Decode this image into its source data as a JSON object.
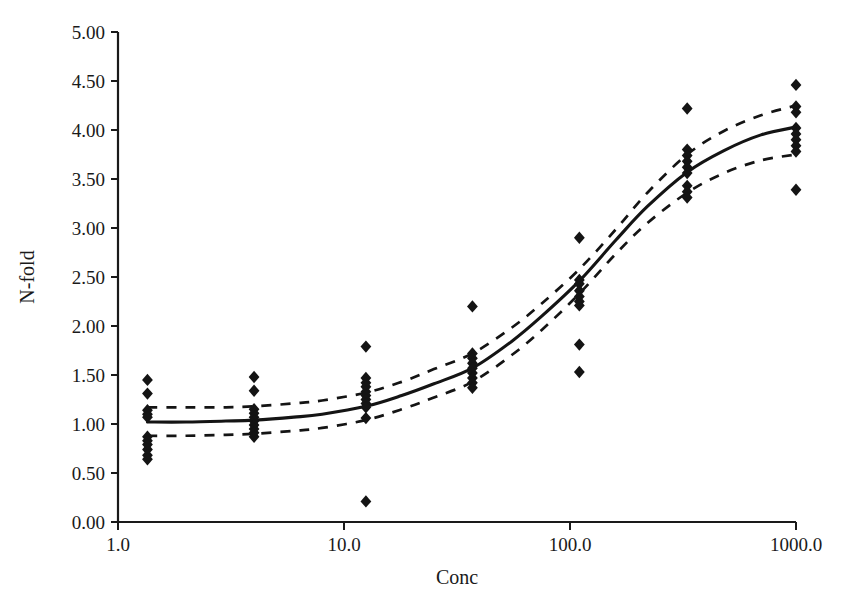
{
  "chart_data": {
    "type": "scatter",
    "title": "",
    "xlabel": "Conc",
    "ylabel": "N-fold",
    "xscale": "log",
    "yscale": "linear",
    "xlim": [
      1.0,
      1000.0
    ],
    "ylim": [
      0.0,
      5.0
    ],
    "grid": false,
    "legend": "none",
    "x_ticks": [
      "1.0",
      "10.0",
      "100.0",
      "1000.0"
    ],
    "x_tick_values": [
      1.0,
      10.0,
      100.0,
      1000.0
    ],
    "y_ticks": [
      "0.00",
      "0.50",
      "1.00",
      "1.50",
      "2.00",
      "2.50",
      "3.00",
      "3.50",
      "4.00",
      "4.50",
      "5.00"
    ],
    "y_tick_values": [
      0.0,
      0.5,
      1.0,
      1.5,
      2.0,
      2.5,
      3.0,
      3.5,
      4.0,
      4.5,
      5.0
    ],
    "marker": "diamond",
    "marker_color": "#141414",
    "series": [
      {
        "name": "Observed N-fold",
        "type": "scatter",
        "points": [
          {
            "x": 1.35,
            "y": 1.45
          },
          {
            "x": 1.35,
            "y": 1.31
          },
          {
            "x": 1.35,
            "y": 1.14
          },
          {
            "x": 1.35,
            "y": 1.1
          },
          {
            "x": 1.35,
            "y": 1.07
          },
          {
            "x": 1.35,
            "y": 0.87
          },
          {
            "x": 1.35,
            "y": 0.83
          },
          {
            "x": 1.35,
            "y": 0.79
          },
          {
            "x": 1.35,
            "y": 0.74
          },
          {
            "x": 1.35,
            "y": 0.68
          },
          {
            "x": 1.35,
            "y": 0.64
          },
          {
            "x": 4.0,
            "y": 1.48
          },
          {
            "x": 4.0,
            "y": 1.34
          },
          {
            "x": 4.0,
            "y": 1.15
          },
          {
            "x": 4.0,
            "y": 1.11
          },
          {
            "x": 4.0,
            "y": 1.07
          },
          {
            "x": 4.0,
            "y": 1.03
          },
          {
            "x": 4.0,
            "y": 0.99
          },
          {
            "x": 4.0,
            "y": 0.95
          },
          {
            "x": 4.0,
            "y": 0.91
          },
          {
            "x": 4.0,
            "y": 0.87
          },
          {
            "x": 12.5,
            "y": 1.79
          },
          {
            "x": 12.5,
            "y": 1.47
          },
          {
            "x": 12.5,
            "y": 1.42
          },
          {
            "x": 12.5,
            "y": 1.38
          },
          {
            "x": 12.5,
            "y": 1.33
          },
          {
            "x": 12.5,
            "y": 1.29
          },
          {
            "x": 12.5,
            "y": 1.25
          },
          {
            "x": 12.5,
            "y": 1.21
          },
          {
            "x": 12.5,
            "y": 1.17
          },
          {
            "x": 12.5,
            "y": 1.06
          },
          {
            "x": 12.5,
            "y": 0.21
          },
          {
            "x": 37.0,
            "y": 2.2
          },
          {
            "x": 37.0,
            "y": 1.72
          },
          {
            "x": 37.0,
            "y": 1.67
          },
          {
            "x": 37.0,
            "y": 1.62
          },
          {
            "x": 37.0,
            "y": 1.57
          },
          {
            "x": 37.0,
            "y": 1.52
          },
          {
            "x": 37.0,
            "y": 1.47
          },
          {
            "x": 37.0,
            "y": 1.42
          },
          {
            "x": 37.0,
            "y": 1.37
          },
          {
            "x": 110.0,
            "y": 2.9
          },
          {
            "x": 110.0,
            "y": 2.47
          },
          {
            "x": 110.0,
            "y": 2.43
          },
          {
            "x": 110.0,
            "y": 2.36
          },
          {
            "x": 110.0,
            "y": 2.3
          },
          {
            "x": 110.0,
            "y": 2.25
          },
          {
            "x": 110.0,
            "y": 2.21
          },
          {
            "x": 110.0,
            "y": 1.81
          },
          {
            "x": 110.0,
            "y": 1.53
          },
          {
            "x": 330.0,
            "y": 4.22
          },
          {
            "x": 330.0,
            "y": 3.8
          },
          {
            "x": 330.0,
            "y": 3.74
          },
          {
            "x": 330.0,
            "y": 3.68
          },
          {
            "x": 330.0,
            "y": 3.62
          },
          {
            "x": 330.0,
            "y": 3.56
          },
          {
            "x": 330.0,
            "y": 3.43
          },
          {
            "x": 330.0,
            "y": 3.37
          },
          {
            "x": 330.0,
            "y": 3.31
          },
          {
            "x": 1000.0,
            "y": 4.46
          },
          {
            "x": 1000.0,
            "y": 4.24
          },
          {
            "x": 1000.0,
            "y": 4.18
          },
          {
            "x": 1000.0,
            "y": 4.02
          },
          {
            "x": 1000.0,
            "y": 3.96
          },
          {
            "x": 1000.0,
            "y": 3.9
          },
          {
            "x": 1000.0,
            "y": 3.84
          },
          {
            "x": 1000.0,
            "y": 3.78
          },
          {
            "x": 1000.0,
            "y": 3.39
          }
        ]
      },
      {
        "name": "Fitted curve",
        "type": "line",
        "style": "solid",
        "points": [
          {
            "x": 1.35,
            "y": 1.02
          },
          {
            "x": 2.0,
            "y": 1.02
          },
          {
            "x": 3.0,
            "y": 1.03
          },
          {
            "x": 4.0,
            "y": 1.04
          },
          {
            "x": 6.0,
            "y": 1.07
          },
          {
            "x": 8.0,
            "y": 1.1
          },
          {
            "x": 12.5,
            "y": 1.18
          },
          {
            "x": 18.0,
            "y": 1.29
          },
          {
            "x": 25.0,
            "y": 1.41
          },
          {
            "x": 37.0,
            "y": 1.57
          },
          {
            "x": 55.0,
            "y": 1.84
          },
          {
            "x": 75.0,
            "y": 2.1
          },
          {
            "x": 110.0,
            "y": 2.46
          },
          {
            "x": 160.0,
            "y": 2.88
          },
          {
            "x": 220.0,
            "y": 3.22
          },
          {
            "x": 330.0,
            "y": 3.57
          },
          {
            "x": 480.0,
            "y": 3.79
          },
          {
            "x": 700.0,
            "y": 3.95
          },
          {
            "x": 1000.0,
            "y": 4.03
          }
        ]
      },
      {
        "name": "Upper confidence band",
        "type": "line",
        "style": "dashed",
        "points": [
          {
            "x": 1.35,
            "y": 1.17
          },
          {
            "x": 2.0,
            "y": 1.17
          },
          {
            "x": 3.0,
            "y": 1.17
          },
          {
            "x": 4.0,
            "y": 1.18
          },
          {
            "x": 6.0,
            "y": 1.21
          },
          {
            "x": 8.0,
            "y": 1.24
          },
          {
            "x": 12.5,
            "y": 1.32
          },
          {
            "x": 18.0,
            "y": 1.43
          },
          {
            "x": 25.0,
            "y": 1.56
          },
          {
            "x": 37.0,
            "y": 1.72
          },
          {
            "x": 55.0,
            "y": 1.98
          },
          {
            "x": 75.0,
            "y": 2.23
          },
          {
            "x": 110.0,
            "y": 2.58
          },
          {
            "x": 160.0,
            "y": 2.99
          },
          {
            "x": 220.0,
            "y": 3.36
          },
          {
            "x": 330.0,
            "y": 3.75
          },
          {
            "x": 480.0,
            "y": 3.99
          },
          {
            "x": 700.0,
            "y": 4.15
          },
          {
            "x": 1000.0,
            "y": 4.25
          }
        ]
      },
      {
        "name": "Lower confidence band",
        "type": "line",
        "style": "dashed",
        "points": [
          {
            "x": 1.35,
            "y": 0.88
          },
          {
            "x": 2.0,
            "y": 0.88
          },
          {
            "x": 3.0,
            "y": 0.89
          },
          {
            "x": 4.0,
            "y": 0.9
          },
          {
            "x": 6.0,
            "y": 0.93
          },
          {
            "x": 8.0,
            "y": 0.96
          },
          {
            "x": 12.5,
            "y": 1.04
          },
          {
            "x": 18.0,
            "y": 1.15
          },
          {
            "x": 25.0,
            "y": 1.27
          },
          {
            "x": 37.0,
            "y": 1.43
          },
          {
            "x": 55.0,
            "y": 1.7
          },
          {
            "x": 75.0,
            "y": 1.96
          },
          {
            "x": 110.0,
            "y": 2.33
          },
          {
            "x": 160.0,
            "y": 2.74
          },
          {
            "x": 220.0,
            "y": 3.05
          },
          {
            "x": 330.0,
            "y": 3.36
          },
          {
            "x": 480.0,
            "y": 3.56
          },
          {
            "x": 700.0,
            "y": 3.69
          },
          {
            "x": 1000.0,
            "y": 3.75
          }
        ]
      }
    ]
  }
}
